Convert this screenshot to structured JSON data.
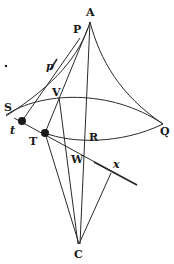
{
  "figure": {
    "type": "geometric-diagram",
    "labels": {
      "A": "A",
      "P": "P",
      "p": "p",
      "V": "V",
      "S": "S",
      "Q": "Q",
      "t": "t",
      "T": "T",
      "R": "R",
      "W": "W",
      "x": "x",
      "C": "C"
    },
    "colors": {
      "ink": "#2a2a2a",
      "background": "#ffffff"
    }
  }
}
